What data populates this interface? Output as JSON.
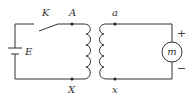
{
  "diagram": {
    "labels": {
      "switch": "K",
      "battery": "E",
      "primary_top": "A",
      "primary_bottom": "X",
      "secondary_top": "a",
      "secondary_bottom": "x",
      "meter": "m",
      "meter_plus": "+",
      "meter_minus": "−"
    },
    "components": [
      {
        "id": "battery",
        "type": "cell",
        "label": "E"
      },
      {
        "id": "switch",
        "type": "switch",
        "label": "K",
        "state": "open"
      },
      {
        "id": "primary-coil",
        "type": "inductor",
        "terminals": [
          "A",
          "X"
        ],
        "turns": 4
      },
      {
        "id": "secondary-coil",
        "type": "inductor",
        "terminals": [
          "a",
          "x"
        ],
        "turns": 4
      },
      {
        "id": "meter",
        "type": "meter",
        "label": "m",
        "polarity": [
          "+",
          "−"
        ]
      }
    ],
    "colors": {
      "line": "#333333"
    }
  }
}
